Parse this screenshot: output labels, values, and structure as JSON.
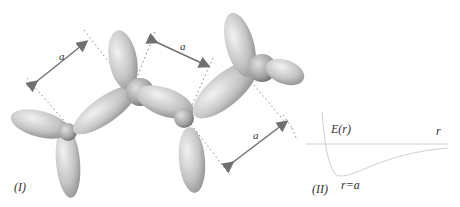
{
  "panel_I": {
    "label": "(I)",
    "distance_label": "a"
  },
  "panel_II": {
    "label": "(II)",
    "y_axis_label": "E(r)",
    "x_axis_label": "r",
    "minimum_label": "r=a"
  },
  "colors": {
    "lobe_light": "#e6e6e6",
    "lobe_dark": "#9a9a9a",
    "arrow": "#707070",
    "dotted": "#888888"
  }
}
